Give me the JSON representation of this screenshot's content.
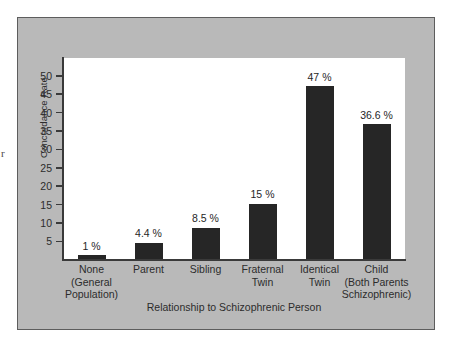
{
  "edge_glyph": "r",
  "chart_data": {
    "type": "bar",
    "title": "",
    "xlabel": "Relationship to Schizophrenic Person",
    "ylabel": "Concordance Rate",
    "ylim": [
      0,
      50
    ],
    "yticks": [
      50,
      45,
      40,
      35,
      30,
      25,
      20,
      15,
      10,
      5
    ],
    "grid": false,
    "legend": "none",
    "bar_color": "#262626",
    "plot_background": "#ffffff",
    "figure_background": "#b9b9b9",
    "categories": [
      "None (General Population)",
      "Parent",
      "Sibling",
      "Fraternal Twin",
      "Identical Twin",
      "Child (Both Parents Schizophrenic)"
    ],
    "category_lines": [
      [
        "None",
        "(General",
        "Population)"
      ],
      [
        "Parent"
      ],
      [
        "Sibling"
      ],
      [
        "Fraternal",
        "Twin"
      ],
      [
        "Identical",
        "Twin"
      ],
      [
        "Child",
        "(Both Parents",
        "Schizophrenic)"
      ]
    ],
    "values": [
      1,
      4.4,
      8.5,
      15,
      47,
      36.6
    ],
    "value_labels": [
      "1 %",
      "4.4 %",
      "8.5 %",
      "15 %",
      "47 %",
      "36.6 %"
    ]
  }
}
